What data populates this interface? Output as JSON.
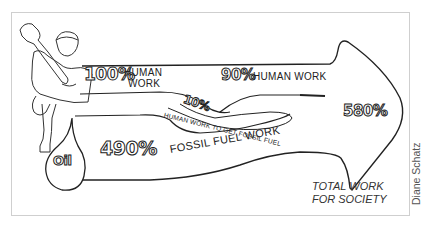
{
  "figure": {
    "labels": {
      "human_work_100_pct": "100%",
      "human_work_100_text_line1": "HUMAN",
      "human_work_100_text_line2": "WORK",
      "human_work_90_pct": "90%",
      "human_work_90_text": "HUMAN WORK",
      "human_work_for_fuel_pct": "10%",
      "human_work_for_fuel_text": "HUMAN WORK TO GET FOSSIL FUEL",
      "oil_label": "Oil",
      "fossil_fuel_pct": "490%",
      "fossil_fuel_text": "FOSSIL FUEL WORK",
      "total_pct": "580%",
      "total_text_line1": "TOTAL WORK",
      "total_text_line2": "FOR SOCIETY"
    },
    "credit": "Diane Schatz",
    "icons": {
      "worker": "worker-with-wrench-illustration",
      "oil_drop": "oil-drop-icon",
      "arrow": "flow-arrow"
    },
    "colors": {
      "ink": "#222222",
      "frame": "#cfcfcf",
      "background": "#ffffff"
    }
  }
}
